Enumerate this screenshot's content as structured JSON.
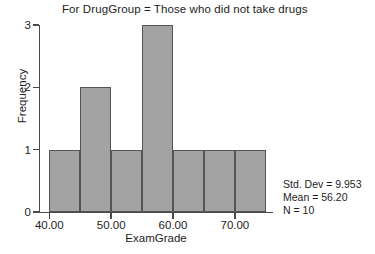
{
  "chart_data": {
    "type": "bar",
    "title": "For DrugGroup = Those who did not take drugs",
    "xlabel": "ExamGrade",
    "ylabel": "Frequency",
    "categories": [
      "40.00-45.00",
      "45.00-50.00",
      "50.00-55.00",
      "55.00-60.00",
      "60.00-65.00",
      "65.00-70.00",
      "70.00-75.00"
    ],
    "bin_edges": [
      40,
      45,
      50,
      55,
      60,
      65,
      70,
      75
    ],
    "bin_width": 5,
    "values": [
      1,
      2,
      1,
      3,
      1,
      1,
      1
    ],
    "x_tick_labels": [
      "40.00",
      "50.00",
      "60.00",
      "70.00"
    ],
    "x_tick_values": [
      40,
      50,
      60,
      70
    ],
    "y_tick_labels": [
      "0",
      "1",
      "2",
      "3"
    ],
    "y_tick_values": [
      0,
      1,
      2,
      3
    ],
    "xlim": [
      38.5,
      76
    ],
    "ylim": [
      0,
      3
    ],
    "grid": false,
    "legend": "none",
    "bar_color": "#a3a3a3",
    "bar_border_color": "#555555",
    "axis_color": "#4a4a4a",
    "background_color": "#ffffff"
  },
  "stats": {
    "std_dev_label": "Std. Dev = 9.953",
    "mean_label": "Mean = 56.20",
    "n_label": "N = 10"
  }
}
